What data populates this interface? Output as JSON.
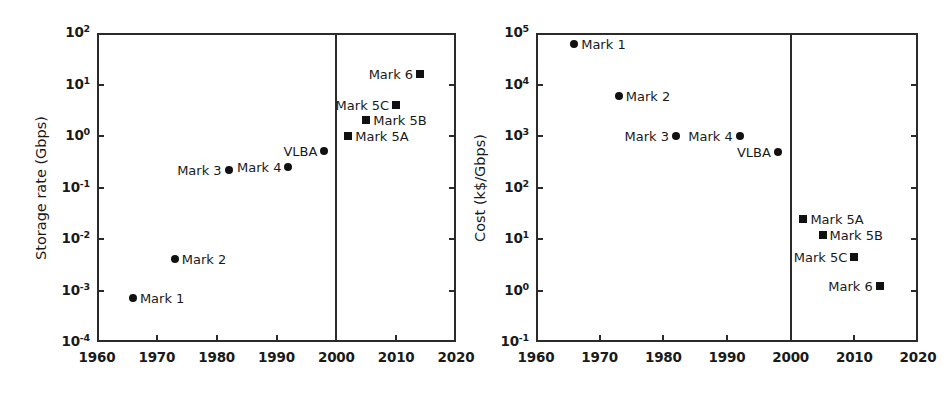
{
  "figure": {
    "background": "#ffffff",
    "marker_color": "#111111",
    "axis_color": "#2b2b2b"
  },
  "chart_data": [
    {
      "type": "scatter",
      "title": "",
      "xlabel": "",
      "ylabel": "Storage rate (Gbps)",
      "xlim": [
        1960,
        2020
      ],
      "ylim": [
        0.0001,
        100
      ],
      "yscale": "log",
      "xscale": "linear",
      "grid": false,
      "legend": "none",
      "xticks": [
        "1960",
        "1970",
        "1980",
        "1990",
        "2000",
        "2010",
        "2020"
      ],
      "xtick_values": [
        1960,
        1970,
        1980,
        1990,
        2000,
        2010,
        2020
      ],
      "ytick_labels": [
        {
          "mantissa": "10",
          "exponent": "2"
        },
        {
          "mantissa": "10",
          "exponent": "1"
        },
        {
          "mantissa": "10",
          "exponent": "0"
        },
        {
          "mantissa": "10",
          "exponent": "-1"
        },
        {
          "mantissa": "10",
          "exponent": "-2"
        },
        {
          "mantissa": "10",
          "exponent": "-3"
        },
        {
          "mantissa": "10",
          "exponent": "-4"
        }
      ],
      "ytick_values": [
        100,
        10,
        1,
        0.1,
        0.01,
        0.001,
        0.0001
      ],
      "annotations": [
        {
          "text": "2000",
          "type": "vertical-divider",
          "x": 2000
        }
      ],
      "points": [
        {
          "label": "Mark 1",
          "x": 1966,
          "y": 0.0007,
          "marker": "circle",
          "label_side": "right"
        },
        {
          "label": "Mark 2",
          "x": 1973,
          "y": 0.004,
          "marker": "circle",
          "label_side": "right"
        },
        {
          "label": "Mark 3",
          "x": 1982,
          "y": 0.22,
          "marker": "circle",
          "label_side": "left"
        },
        {
          "label": "Mark 4",
          "x": 1992,
          "y": 0.25,
          "marker": "circle",
          "label_side": "left"
        },
        {
          "label": "VLBA",
          "x": 1998,
          "y": 0.52,
          "marker": "circle",
          "label_side": "left"
        },
        {
          "label": "Mark 5A",
          "x": 2002,
          "y": 1.0,
          "marker": "square",
          "label_side": "right"
        },
        {
          "label": "Mark 5B",
          "x": 2005,
          "y": 2.0,
          "marker": "square",
          "label_side": "right"
        },
        {
          "label": "Mark 5C",
          "x": 2010,
          "y": 4.0,
          "marker": "square",
          "label_side": "left"
        },
        {
          "label": "Mark 6",
          "x": 2014,
          "y": 16.0,
          "marker": "square",
          "label_side": "left"
        }
      ]
    },
    {
      "type": "scatter",
      "title": "",
      "xlabel": "",
      "ylabel": "Cost (k$/Gbps)",
      "xlim": [
        1960,
        2020
      ],
      "ylim": [
        0.1,
        100000
      ],
      "yscale": "log",
      "xscale": "linear",
      "grid": false,
      "legend": "none",
      "xticks": [
        "1960",
        "1970",
        "1980",
        "1990",
        "2000",
        "2010",
        "2020"
      ],
      "xtick_values": [
        1960,
        1970,
        1980,
        1990,
        2000,
        2010,
        2020
      ],
      "ytick_labels": [
        {
          "mantissa": "10",
          "exponent": "5"
        },
        {
          "mantissa": "10",
          "exponent": "4"
        },
        {
          "mantissa": "10",
          "exponent": "3"
        },
        {
          "mantissa": "10",
          "exponent": "2"
        },
        {
          "mantissa": "10",
          "exponent": "1"
        },
        {
          "mantissa": "10",
          "exponent": "0"
        },
        {
          "mantissa": "10",
          "exponent": "-1"
        }
      ],
      "ytick_values": [
        100000,
        10000,
        1000,
        100,
        10,
        1,
        0.1
      ],
      "annotations": [
        {
          "text": "2000",
          "type": "vertical-divider",
          "x": 2000
        }
      ],
      "points": [
        {
          "label": "Mark 1",
          "x": 1966,
          "y": 60000,
          "marker": "circle",
          "label_side": "right"
        },
        {
          "label": "Mark 2",
          "x": 1973,
          "y": 6000,
          "marker": "circle",
          "label_side": "right"
        },
        {
          "label": "Mark 3",
          "x": 1982,
          "y": 1000,
          "marker": "circle",
          "label_side": "left"
        },
        {
          "label": "Mark 4",
          "x": 1992,
          "y": 1000,
          "marker": "circle",
          "label_side": "left"
        },
        {
          "label": "VLBA",
          "x": 1998,
          "y": 500,
          "marker": "circle",
          "label_side": "left"
        },
        {
          "label": "Mark 5A",
          "x": 2002,
          "y": 25,
          "marker": "square",
          "label_side": "right"
        },
        {
          "label": "Mark 5B",
          "x": 2005,
          "y": 12,
          "marker": "square",
          "label_side": "right"
        },
        {
          "label": "Mark 5C",
          "x": 2010,
          "y": 4.5,
          "marker": "square",
          "label_side": "left"
        },
        {
          "label": "Mark 6",
          "x": 2014,
          "y": 1.2,
          "marker": "square",
          "label_side": "left"
        }
      ]
    }
  ]
}
